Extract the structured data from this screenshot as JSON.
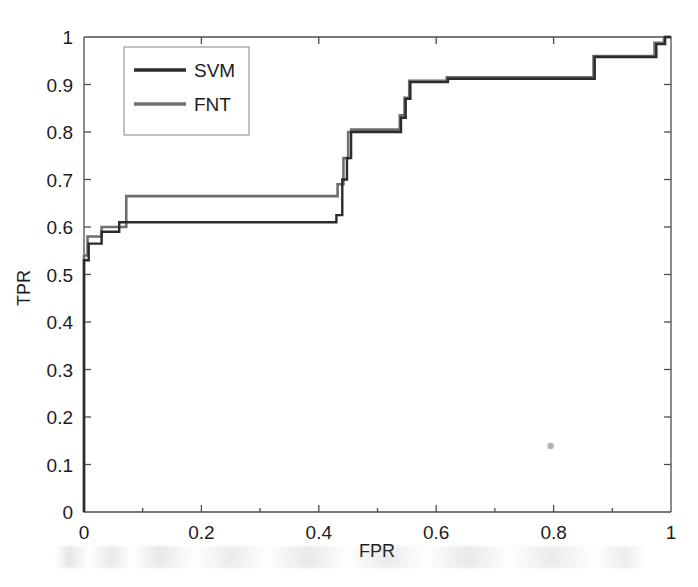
{
  "figure": {
    "background_color": "#ffffff",
    "axis_color": "#4d4d4d"
  },
  "chart_data": {
    "type": "line",
    "title": "",
    "subtitle": "",
    "xlabel": "FPR",
    "ylabel": "TPR",
    "xlim": [
      0,
      1
    ],
    "ylim": [
      0,
      1
    ],
    "grid": false,
    "legend_position": "upper-left-inside",
    "xticks": [
      0,
      0.2,
      0.4,
      0.6,
      0.8,
      1
    ],
    "xtick_labels": [
      "0",
      "0.2",
      "0.4",
      "0.6",
      "0.8",
      "1"
    ],
    "yticks": [
      0,
      0.1,
      0.2,
      0.3,
      0.4,
      0.5,
      0.6,
      0.7,
      0.8,
      0.9,
      1
    ],
    "ytick_labels": [
      "0",
      "0.1",
      "0.2",
      "0.3",
      "0.4",
      "0.5",
      "0.6",
      "0.7",
      "0.8",
      "0.9",
      "1"
    ],
    "minor_xticks": [
      0.1,
      0.3,
      0.5,
      0.7,
      0.9
    ],
    "series": [
      {
        "name": "SVM",
        "color": "#2b2b2b",
        "line_width": 2.4,
        "style": "step-post",
        "points": [
          [
            0.0,
            0.0
          ],
          [
            0.0,
            0.53
          ],
          [
            0.008,
            0.53
          ],
          [
            0.008,
            0.565
          ],
          [
            0.03,
            0.565
          ],
          [
            0.03,
            0.59
          ],
          [
            0.06,
            0.59
          ],
          [
            0.06,
            0.61
          ],
          [
            0.43,
            0.61
          ],
          [
            0.43,
            0.625
          ],
          [
            0.44,
            0.625
          ],
          [
            0.44,
            0.7
          ],
          [
            0.448,
            0.7
          ],
          [
            0.448,
            0.745
          ],
          [
            0.455,
            0.745
          ],
          [
            0.455,
            0.8
          ],
          [
            0.54,
            0.8
          ],
          [
            0.54,
            0.83
          ],
          [
            0.548,
            0.83
          ],
          [
            0.548,
            0.87
          ],
          [
            0.556,
            0.87
          ],
          [
            0.556,
            0.905
          ],
          [
            0.62,
            0.905
          ],
          [
            0.62,
            0.912
          ],
          [
            0.87,
            0.912
          ],
          [
            0.87,
            0.958
          ],
          [
            0.975,
            0.958
          ],
          [
            0.975,
            0.985
          ],
          [
            0.99,
            0.985
          ],
          [
            0.99,
            1.0
          ],
          [
            1.0,
            1.0
          ]
        ]
      },
      {
        "name": "FNT",
        "color": "#6f6f6f",
        "line_width": 2.6,
        "style": "step-post",
        "points": [
          [
            0.0,
            0.0
          ],
          [
            0.0,
            0.54
          ],
          [
            0.006,
            0.54
          ],
          [
            0.006,
            0.58
          ],
          [
            0.03,
            0.58
          ],
          [
            0.03,
            0.6
          ],
          [
            0.072,
            0.6
          ],
          [
            0.072,
            0.665
          ],
          [
            0.432,
            0.665
          ],
          [
            0.432,
            0.69
          ],
          [
            0.442,
            0.69
          ],
          [
            0.442,
            0.745
          ],
          [
            0.45,
            0.745
          ],
          [
            0.45,
            0.8
          ],
          [
            0.455,
            0.8
          ],
          [
            0.455,
            0.805
          ],
          [
            0.538,
            0.805
          ],
          [
            0.538,
            0.835
          ],
          [
            0.546,
            0.835
          ],
          [
            0.546,
            0.872
          ],
          [
            0.554,
            0.872
          ],
          [
            0.554,
            0.908
          ],
          [
            0.618,
            0.908
          ],
          [
            0.618,
            0.915
          ],
          [
            0.868,
            0.915
          ],
          [
            0.868,
            0.96
          ],
          [
            0.972,
            0.96
          ],
          [
            0.972,
            0.988
          ],
          [
            0.988,
            0.988
          ],
          [
            0.988,
            1.0
          ],
          [
            1.0,
            1.0
          ]
        ]
      }
    ],
    "annotations": [
      {
        "name": "stray-dot",
        "x": 0.795,
        "y": 0.139,
        "color": "#9a9a9a",
        "radius": 3.2
      }
    ]
  },
  "legend": {
    "entries": [
      {
        "label": "SVM",
        "color": "#2b2b2b",
        "line_width": 3.4
      },
      {
        "label": "FNT",
        "color": "#6f6f6f",
        "line_width": 3.4
      }
    ]
  }
}
